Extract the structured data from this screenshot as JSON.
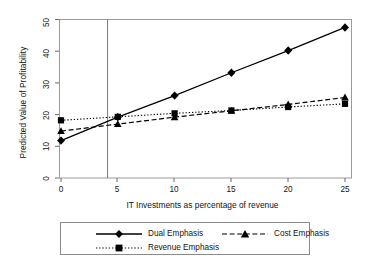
{
  "chart_data": {
    "type": "line",
    "title": "",
    "xlabel": "IT Investments as percentage of revenue",
    "ylabel": "Predicted Value of Profitability",
    "x": [
      0,
      5,
      10,
      15,
      20,
      25
    ],
    "xticks": [
      "0",
      "5",
      "10",
      "15",
      "20",
      "25"
    ],
    "yticks": [
      "0",
      "10",
      "20",
      "30",
      "40",
      "50"
    ],
    "xlim": [
      0,
      25
    ],
    "ylim": [
      0,
      50
    ],
    "grid": false,
    "legend_position": "bottom",
    "series": [
      {
        "name": "Dual Emphasis",
        "values": [
          11.8,
          19.2,
          26.0,
          33.2,
          40.2,
          47.5
        ],
        "marker": "diamond",
        "linestyle": "solid",
        "color": "#000000"
      },
      {
        "name": "Cost Emphasis",
        "values": [
          14.8,
          17.0,
          19.2,
          21.2,
          23.2,
          25.4
        ],
        "marker": "triangle",
        "linestyle": "dashed",
        "color": "#000000"
      },
      {
        "name": "Revenue Emphasis",
        "values": [
          18.2,
          19.3,
          20.4,
          21.3,
          22.4,
          23.4
        ],
        "marker": "square",
        "linestyle": "dotted",
        "color": "#000000"
      }
    ],
    "annotations": [
      {
        "type": "vertical-reference-line",
        "x": 4.1,
        "color": "#777777"
      }
    ]
  },
  "legend": {
    "items": [
      {
        "label": "Dual Emphasis"
      },
      {
        "label": "Cost Emphasis"
      },
      {
        "label": "Revenue Emphasis"
      }
    ]
  },
  "axes": {
    "y_title": "Predicted Value of Profitability",
    "x_title": "IT Investments as percentage of revenue",
    "y_tick_labels": [
      "0",
      "10",
      "20",
      "30",
      "40",
      "50"
    ],
    "x_tick_labels": [
      "0",
      "5",
      "10",
      "15",
      "20",
      "25"
    ]
  }
}
